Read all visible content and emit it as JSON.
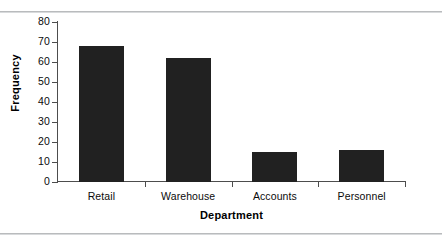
{
  "chart_data": {
    "type": "bar",
    "title": "",
    "subtitle": "",
    "xlabel": "Department",
    "ylabel": "Frequency",
    "categories": [
      "Retail",
      "Warehouse",
      "Accounts",
      "Personnel"
    ],
    "values": [
      68,
      62,
      15,
      16
    ],
    "ylim": [
      0,
      80
    ],
    "ytick_labels": [
      "0",
      "10",
      "20",
      "30",
      "40",
      "50",
      "60",
      "70",
      "80"
    ],
    "ytick_values": [
      0,
      10,
      20,
      30,
      40,
      50,
      60,
      70,
      80
    ],
    "ytick_step": 10,
    "grid": false,
    "legend": false,
    "legend_position": "none",
    "bar_color": "#212121",
    "axis_color": "#4d4d4d",
    "background_color": "#ffffff",
    "rule_color": "#b9bbbd",
    "annotations": []
  }
}
